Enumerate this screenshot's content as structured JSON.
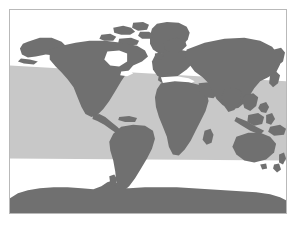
{
  "figure": {
    "kind": "world-map",
    "title": "World map with shaded latitudinal band",
    "caption": "",
    "background_color": "#ffffff",
    "width_px": 299,
    "height_px": 225
  },
  "frame": {
    "border_color": "#b9b9b9",
    "border_width_px": 1,
    "left_px": 9,
    "top_px": 9,
    "width_px": 278,
    "height_px": 205
  },
  "map": {
    "projection": "robinson-like",
    "ocean_color": "#ffffff",
    "land_color": "#707070",
    "band_color": "#c8c8c8",
    "land_label": "Landmasses",
    "ocean_label": "Oceans",
    "band_label": "Shaded latitudinal band",
    "legend_visible": false,
    "graticule_visible": false,
    "labels_visible": false
  },
  "chart_data": {
    "type": "map",
    "title": "World map with shaded latitudinal band",
    "xlabel": "",
    "ylabel": "",
    "series": [
      {
        "name": "Shaded latitudinal band",
        "color": "#c8c8c8",
        "description": "Light gray horizontal band spanning full map width, sloping slightly downward from left to right at its top edge",
        "polygon_norm": [
          [
            0.0,
            0.27
          ],
          [
            1.0,
            0.35
          ],
          [
            1.0,
            0.74
          ],
          [
            0.0,
            0.735
          ]
        ]
      },
      {
        "name": "Landmasses",
        "color": "#707070",
        "regions": [
          "North America",
          "Greenland",
          "Central America",
          "South America",
          "Europe",
          "Africa",
          "Madagascar",
          "Asia",
          "Southeast Asian archipelago",
          "Japan",
          "Australia",
          "New Zealand",
          "Antarctica"
        ]
      }
    ]
  }
}
